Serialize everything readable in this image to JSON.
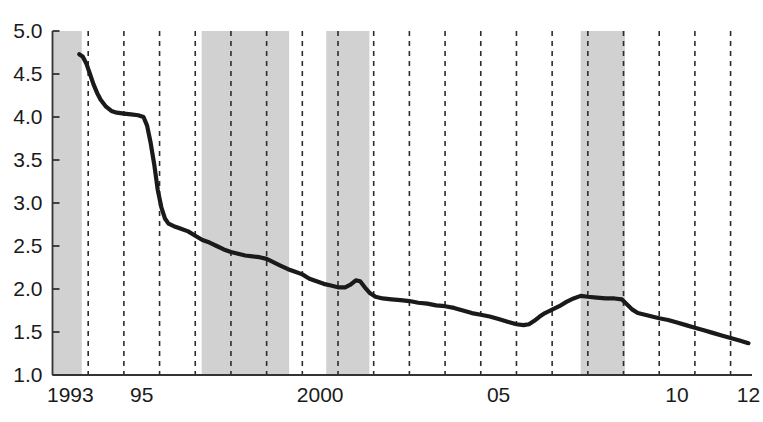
{
  "chart_data": {
    "type": "line",
    "title": "",
    "subtitle": "",
    "xlabel": "",
    "ylabel": "",
    "xlim": [
      1993.0,
      2012.6
    ],
    "ylim": [
      1.0,
      5.0
    ],
    "grid": "vertical dashed gridlines at each year boundary",
    "legend": "none",
    "y_ticks": [
      "5.0",
      "4.5",
      "4.0",
      "3.5",
      "3.0",
      "2.5",
      "2.0",
      "1.5",
      "1.0"
    ],
    "y_tick_values": [
      5.0,
      4.5,
      4.0,
      3.5,
      3.0,
      2.5,
      2.0,
      1.5,
      1.0
    ],
    "x_ticks": [
      "1993",
      "95",
      "2000",
      "05",
      "10",
      "12"
    ],
    "x_tick_values": [
      1993,
      1995,
      2000,
      2005,
      2010,
      2012
    ],
    "shaded_bands": [
      {
        "label": "recession-band-1",
        "start": 1993.0,
        "end": 1993.82,
        "color": "#b4b4b4"
      },
      {
        "label": "recession-band-2",
        "start": 1997.18,
        "end": 1999.63,
        "color": "#b4b4b4"
      },
      {
        "label": "recession-band-3",
        "start": 2000.67,
        "end": 2001.88,
        "color": "#b4b4b4"
      },
      {
        "label": "recession-band-4",
        "start": 2007.8,
        "end": 2009.04,
        "color": "#b4b4b4"
      }
    ],
    "series": [
      {
        "name": "series-1",
        "color": "#1a1a1a",
        "points": [
          [
            1993.75,
            4.73
          ],
          [
            1993.85,
            4.7
          ],
          [
            1993.95,
            4.62
          ],
          [
            1994.05,
            4.5
          ],
          [
            1994.15,
            4.38
          ],
          [
            1994.25,
            4.28
          ],
          [
            1994.35,
            4.2
          ],
          [
            1994.5,
            4.12
          ],
          [
            1994.65,
            4.07
          ],
          [
            1994.8,
            4.05
          ],
          [
            1995.0,
            4.04
          ],
          [
            1995.2,
            4.03
          ],
          [
            1995.4,
            4.02
          ],
          [
            1995.55,
            4.0
          ],
          [
            1995.65,
            3.9
          ],
          [
            1995.75,
            3.7
          ],
          [
            1995.85,
            3.45
          ],
          [
            1995.95,
            3.15
          ],
          [
            1996.05,
            2.95
          ],
          [
            1996.15,
            2.82
          ],
          [
            1996.25,
            2.76
          ],
          [
            1996.4,
            2.73
          ],
          [
            1996.6,
            2.7
          ],
          [
            1996.8,
            2.67
          ],
          [
            1997.0,
            2.62
          ],
          [
            1997.2,
            2.57
          ],
          [
            1997.4,
            2.54
          ],
          [
            1997.6,
            2.5
          ],
          [
            1997.8,
            2.46
          ],
          [
            1998.0,
            2.43
          ],
          [
            1998.2,
            2.41
          ],
          [
            1998.4,
            2.39
          ],
          [
            1998.6,
            2.38
          ],
          [
            1998.8,
            2.37
          ],
          [
            1999.0,
            2.35
          ],
          [
            1999.2,
            2.31
          ],
          [
            1999.4,
            2.27
          ],
          [
            1999.6,
            2.23
          ],
          [
            1999.8,
            2.2
          ],
          [
            2000.0,
            2.17
          ],
          [
            2000.2,
            2.12
          ],
          [
            2000.4,
            2.09
          ],
          [
            2000.6,
            2.06
          ],
          [
            2000.8,
            2.04
          ],
          [
            2001.0,
            2.02
          ],
          [
            2001.2,
            2.02
          ],
          [
            2001.35,
            2.05
          ],
          [
            2001.5,
            2.1
          ],
          [
            2001.62,
            2.09
          ],
          [
            2001.75,
            2.02
          ],
          [
            2001.9,
            1.95
          ],
          [
            2002.05,
            1.91
          ],
          [
            2002.25,
            1.89
          ],
          [
            2002.5,
            1.88
          ],
          [
            2002.75,
            1.87
          ],
          [
            2003.0,
            1.86
          ],
          [
            2003.25,
            1.84
          ],
          [
            2003.5,
            1.83
          ],
          [
            2003.75,
            1.81
          ],
          [
            2004.0,
            1.8
          ],
          [
            2004.25,
            1.78
          ],
          [
            2004.5,
            1.75
          ],
          [
            2004.75,
            1.72
          ],
          [
            2005.0,
            1.7
          ],
          [
            2005.25,
            1.68
          ],
          [
            2005.5,
            1.65
          ],
          [
            2005.75,
            1.62
          ],
          [
            2006.0,
            1.59
          ],
          [
            2006.2,
            1.58
          ],
          [
            2006.35,
            1.59
          ],
          [
            2006.5,
            1.63
          ],
          [
            2006.65,
            1.68
          ],
          [
            2006.8,
            1.72
          ],
          [
            2007.0,
            1.76
          ],
          [
            2007.2,
            1.8
          ],
          [
            2007.4,
            1.85
          ],
          [
            2007.6,
            1.89
          ],
          [
            2007.8,
            1.92
          ],
          [
            2008.0,
            1.91
          ],
          [
            2008.25,
            1.9
          ],
          [
            2008.5,
            1.89
          ],
          [
            2008.75,
            1.89
          ],
          [
            2008.95,
            1.88
          ],
          [
            2009.1,
            1.82
          ],
          [
            2009.25,
            1.76
          ],
          [
            2009.4,
            1.72
          ],
          [
            2009.6,
            1.7
          ],
          [
            2009.8,
            1.68
          ],
          [
            2010.0,
            1.66
          ],
          [
            2010.25,
            1.64
          ],
          [
            2010.5,
            1.61
          ],
          [
            2010.75,
            1.58
          ],
          [
            2011.0,
            1.55
          ],
          [
            2011.25,
            1.52
          ],
          [
            2011.5,
            1.49
          ],
          [
            2011.75,
            1.46
          ],
          [
            2012.0,
            1.43
          ],
          [
            2012.25,
            1.4
          ],
          [
            2012.5,
            1.37
          ]
        ]
      }
    ]
  }
}
